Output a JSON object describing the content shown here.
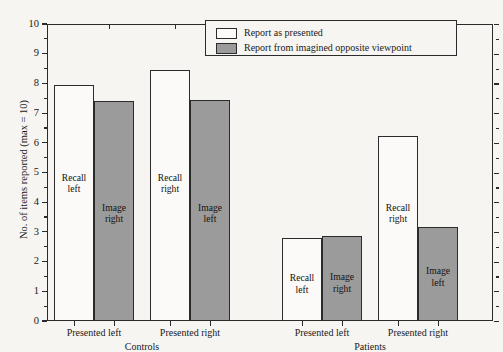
{
  "chart_data": {
    "type": "bar",
    "title": "",
    "xlabel": "",
    "ylabel": "No. of items reported (max = 10)",
    "ylim": [
      0,
      10
    ],
    "ytick_step": 1,
    "grid": false,
    "legend_position": "top-center",
    "groups": [
      {
        "name": "Controls",
        "conditions": [
          {
            "label": "Presented left",
            "bars": [
              {
                "series": "Report as presented",
                "value": 7.95,
                "annotation": "Recall\nleft",
                "annotation_line1": "Recall",
                "annotation_line2": "left"
              },
              {
                "series": "Report from imagined opposite viewpoint",
                "value": 7.42,
                "annotation_line1": "Image",
                "annotation_line2": "right"
              }
            ]
          },
          {
            "label": "Presented right",
            "bars": [
              {
                "series": "Report as presented",
                "value": 8.45,
                "annotation_line1": "Recall",
                "annotation_line2": "right"
              },
              {
                "series": "Report from imagined opposite viewpoint",
                "value": 7.43,
                "annotation_line1": "Image",
                "annotation_line2": "left"
              }
            ]
          }
        ]
      },
      {
        "name": "Patients",
        "conditions": [
          {
            "label": "Presented left",
            "bars": [
              {
                "series": "Report as presented",
                "value": 2.78,
                "annotation_line1": "Recall",
                "annotation_line2": "left"
              },
              {
                "series": "Report from imagined opposite viewpoint",
                "value": 2.85,
                "annotation_line1": "Image",
                "annotation_line2": "right"
              }
            ]
          },
          {
            "label": "Presented right",
            "bars": [
              {
                "series": "Report as presented",
                "value": 6.22,
                "annotation_line1": "Recall",
                "annotation_line2": "right"
              },
              {
                "series": "Report from imagined opposite viewpoint",
                "value": 3.18,
                "annotation_line1": "Image",
                "annotation_line2": "left"
              }
            ]
          }
        ]
      }
    ],
    "series": [
      {
        "name": "Report as presented",
        "style": "open",
        "color": "#fbfaf8"
      },
      {
        "name": "Report from imagined opposite viewpoint",
        "style": "filled",
        "color": "#9b9b9b"
      }
    ],
    "ytick_labels": [
      "0",
      "1",
      "2",
      "3",
      "4",
      "5",
      "6",
      "7",
      "8",
      "9",
      "10"
    ]
  },
  "legend": {
    "items": [
      {
        "label": "Report as presented",
        "style": "open"
      },
      {
        "label": "Report from imagined opposite viewpoint",
        "style": "filled"
      }
    ]
  },
  "axis": {
    "y_title": "No. of items reported (max = 10)"
  },
  "colors": {
    "background": "#f6f5f2",
    "axis": "#2b2b2b",
    "bar_open": "#fbfaf8",
    "bar_filled": "#9b9b9b",
    "text": "#14110f"
  }
}
